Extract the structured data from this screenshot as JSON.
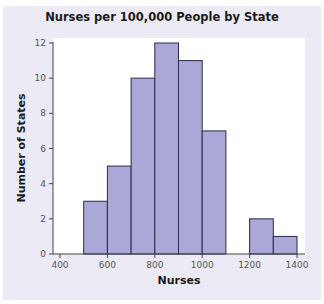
{
  "chart_data": {
    "type": "bar",
    "subtype": "histogram",
    "title": "Nurses per 100,000 People by State",
    "xlabel": "Nurses",
    "ylabel": "Number of States",
    "bin_edges": [
      500,
      600,
      700,
      800,
      900,
      1000,
      1100,
      1200,
      1300,
      1400
    ],
    "categories": [
      "500-600",
      "600-700",
      "700-800",
      "800-900",
      "900-1000",
      "1000-1100",
      "1100-1200",
      "1200-1300",
      "1300-1400"
    ],
    "values": [
      3,
      5,
      10,
      12,
      11,
      7,
      0,
      2,
      1
    ],
    "xlim": [
      400,
      1400
    ],
    "ylim": [
      0,
      12
    ],
    "x_ticks": [
      400,
      600,
      800,
      1000,
      1200,
      1400
    ],
    "y_ticks": [
      0,
      2,
      4,
      6,
      8,
      10,
      12
    ],
    "grid": false,
    "legend": null,
    "colors": {
      "bar_fill": "#a9a8d6",
      "bar_edge": "#2b2a4a",
      "panel_bg": "#ecebf5",
      "plot_bg": "#ffffff"
    }
  },
  "labels": {
    "title": "Nurses per 100,000 People by State",
    "xlabel": "Nurses",
    "ylabel": "Number of States"
  }
}
